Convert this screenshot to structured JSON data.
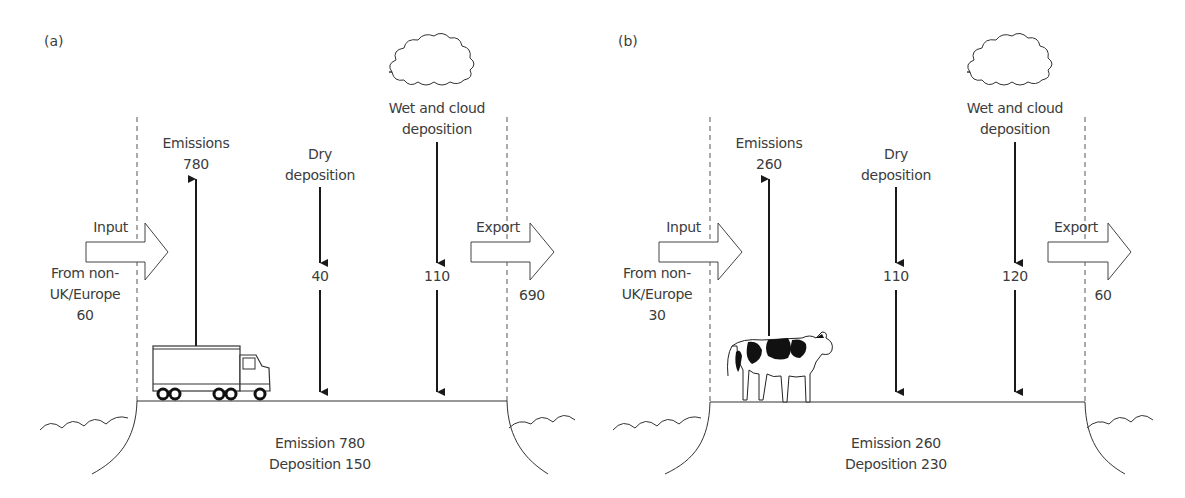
{
  "figure": {
    "panels": [
      {
        "tag": "(a)",
        "emissions_label": "Emissions",
        "emissions_value": "780",
        "dry_label_line1": "Dry",
        "dry_label_line2": "deposition",
        "dry_value": "40",
        "wet_label_line1": "Wet and cloud",
        "wet_label_line2": "deposition",
        "wet_value": "110",
        "input_label": "Input",
        "input_source_line1": "From non-",
        "input_source_line2": "UK/Europe",
        "input_value": "60",
        "export_label": "Export",
        "export_value": "690",
        "summary_line1": "Emission 780",
        "summary_line2": "Deposition 150",
        "source_icon": "truck-icon"
      },
      {
        "tag": "(b)",
        "emissions_label": "Emissions",
        "emissions_value": "260",
        "dry_label_line1": "Dry",
        "dry_label_line2": "deposition",
        "dry_value": "110",
        "wet_label_line1": "Wet and cloud",
        "wet_label_line2": "deposition",
        "wet_value": "120",
        "input_label": "Input",
        "input_source_line1": "From non-",
        "input_source_line2": "UK/Europe",
        "input_value": "30",
        "export_label": "Export",
        "export_value": "60",
        "summary_line1": "Emission 260",
        "summary_line2": "Deposition 230",
        "source_icon": "cow-icon"
      }
    ]
  }
}
